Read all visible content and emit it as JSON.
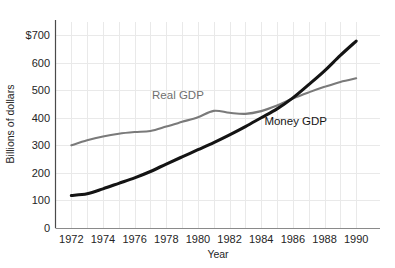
{
  "chart_data": {
    "type": "line",
    "title": "",
    "xlabel": "Year",
    "ylabel": "Billions of dollars",
    "xlim": [
      1971,
      1991
    ],
    "ylim": [
      0,
      740
    ],
    "grid": true,
    "legend_position": "inline-annotations",
    "x": [
      1972,
      1973,
      1974,
      1975,
      1976,
      1977,
      1978,
      1979,
      1980,
      1981,
      1982,
      1983,
      1984,
      1985,
      1986,
      1987,
      1988,
      1989,
      1990
    ],
    "x_tick_labels": [
      "1972",
      "1974",
      "1976",
      "1978",
      "1980",
      "1982",
      "1984",
      "1986",
      "1988",
      "1990"
    ],
    "x_tick_values": [
      1972,
      1974,
      1976,
      1978,
      1980,
      1982,
      1984,
      1986,
      1988,
      1990
    ],
    "y_tick_labels": [
      "0",
      "100",
      "200",
      "300",
      "400",
      "500",
      "600",
      "$700"
    ],
    "y_tick_values": [
      0,
      100,
      200,
      300,
      400,
      500,
      600,
      700
    ],
    "series": [
      {
        "name": "Real GDP",
        "color": "#7a7a7a",
        "label_x": 1977.1,
        "label_y": 468,
        "values": [
          300,
          318,
          332,
          342,
          348,
          352,
          368,
          385,
          402,
          425,
          418,
          414,
          424,
          444,
          470,
          492,
          512,
          530,
          543
        ]
      },
      {
        "name": "Money GDP",
        "color": "#141414",
        "label_x": 1984.2,
        "label_y": 372,
        "values": [
          118,
          124,
          142,
          162,
          182,
          205,
          232,
          258,
          284,
          310,
          338,
          368,
          400,
          432,
          472,
          520,
          570,
          626,
          678
        ]
      }
    ],
    "annotations": [
      {
        "text": "Real GDP",
        "series": "Real GDP"
      },
      {
        "text": "Money GDP",
        "series": "Money GDP"
      }
    ]
  },
  "axes": {
    "y_title": "Billions of dollars",
    "x_title": "Year"
  },
  "colors": {
    "background": "#ffffff",
    "grid": "#e9e9e9",
    "axis": "#4a4a4a",
    "x_axis": "#8a8a8a",
    "text": "#252525",
    "real_gdp": "#7a7a7a",
    "money_gdp": "#141414"
  }
}
